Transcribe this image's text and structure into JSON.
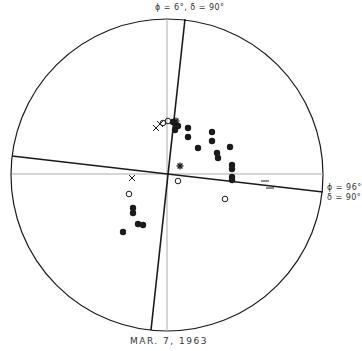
{
  "diagram": {
    "top_label": "ϕ = 6°,  δ = 90°",
    "right_label_line1": "ϕ = 96°",
    "right_label_line2": "δ = 90°",
    "date_caption": "MAR. 7, 1963",
    "circle": {
      "cx": 167,
      "cy": 175,
      "r": 156
    },
    "colors": {
      "ink": "#1a1a1a",
      "gray_axis": "#aaaaaa",
      "background": "#ffffff"
    },
    "filled_points": [
      [
        188,
        128
      ],
      [
        188,
        137
      ],
      [
        212,
        132
      ],
      [
        212,
        141
      ],
      [
        198,
        148
      ],
      [
        230,
        147
      ],
      [
        217,
        153
      ],
      [
        218,
        158
      ],
      [
        232,
        165
      ],
      [
        232,
        169
      ],
      [
        232,
        177
      ],
      [
        232,
        180
      ],
      [
        133,
        208
      ],
      [
        133,
        213
      ],
      [
        138,
        224
      ],
      [
        143,
        225
      ],
      [
        123,
        232
      ],
      [
        173,
        122
      ],
      [
        176,
        125
      ],
      [
        175,
        130
      ],
      [
        178,
        126
      ]
    ],
    "open_points": [
      [
        163,
        123
      ],
      [
        168,
        121
      ],
      [
        129,
        194
      ],
      [
        178,
        181
      ],
      [
        225,
        199
      ]
    ],
    "cross_points": [
      [
        160,
        124
      ],
      [
        156,
        128
      ],
      [
        132,
        178
      ]
    ],
    "star_points": [
      [
        180,
        166
      ],
      [
        176,
        121
      ]
    ],
    "dash_marks": [
      [
        265,
        181
      ],
      [
        270,
        188
      ]
    ]
  }
}
